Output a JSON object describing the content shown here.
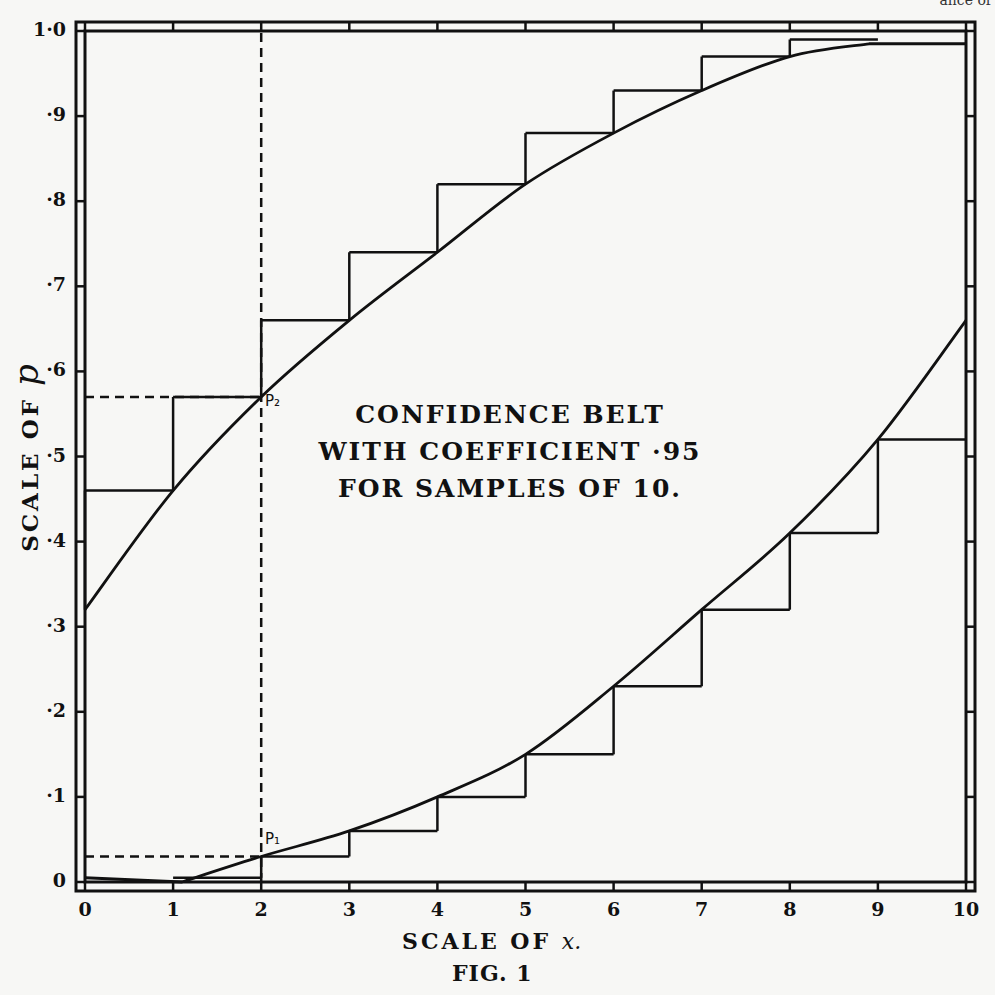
{
  "header_fragment": "ance of",
  "figure": {
    "title_lines": [
      "CONFIDENCE BELT",
      "WITH COEFFICIENT ·95",
      "FOR SAMPLES OF 10."
    ],
    "caption": "FIG. 1",
    "x_axis_title": "SCALE OF",
    "x_axis_var": "x.",
    "y_axis_title": "SCALE OF",
    "y_axis_var": "p",
    "point_labels": {
      "p1": "P₁",
      "p2": "P₂"
    },
    "x_tick_labels": [
      "0",
      "1",
      "2",
      "3",
      "4",
      "5",
      "6",
      "7",
      "8",
      "9",
      "10"
    ],
    "y_tick_labels": [
      "0",
      "·1",
      "·2",
      "·3",
      "·4",
      "·5",
      "·6",
      "·7",
      "·8",
      "·9",
      "1·0"
    ]
  },
  "colors": {
    "ink": "#111111",
    "paper": "#f7f7f5"
  },
  "chart_data": {
    "type": "line",
    "caption": "FIG. 1",
    "xlabel": "Scale of x",
    "ylabel": "Scale of p",
    "xlim": [
      0,
      10
    ],
    "ylim": [
      0,
      1.0
    ],
    "x_ticks": [
      0,
      1,
      2,
      3,
      4,
      5,
      6,
      7,
      8,
      9,
      10
    ],
    "y_ticks": [
      0,
      0.1,
      0.2,
      0.3,
      0.4,
      0.5,
      0.6,
      0.7,
      0.8,
      0.9,
      1.0
    ],
    "grid": false,
    "series": [
      {
        "name": "Upper confidence limit (smooth curve)",
        "x": [
          0,
          1,
          2,
          3,
          4,
          5,
          6,
          7,
          8,
          8.9
        ],
        "y": [
          0.32,
          0.46,
          0.57,
          0.66,
          0.74,
          0.82,
          0.88,
          0.93,
          0.97,
          0.985
        ]
      },
      {
        "name": "Upper confidence limit (step function)",
        "steps": [
          {
            "x0": 0,
            "x1": 1,
            "y": 0.46
          },
          {
            "x0": 1,
            "x1": 2,
            "y": 0.57
          },
          {
            "x0": 2,
            "x1": 3,
            "y": 0.66
          },
          {
            "x0": 3,
            "x1": 4,
            "y": 0.74
          },
          {
            "x0": 4,
            "x1": 5,
            "y": 0.82
          },
          {
            "x0": 5,
            "x1": 6,
            "y": 0.88
          },
          {
            "x0": 6,
            "x1": 7,
            "y": 0.93
          },
          {
            "x0": 7,
            "x1": 8,
            "y": 0.97
          },
          {
            "x0": 8,
            "x1": 9,
            "y": 0.99
          }
        ]
      },
      {
        "name": "Lower confidence limit (smooth curve)",
        "x": [
          1.1,
          2,
          3,
          4,
          5,
          6,
          7,
          8,
          9,
          10
        ],
        "y": [
          0.0,
          0.03,
          0.06,
          0.1,
          0.15,
          0.23,
          0.32,
          0.41,
          0.52,
          0.66
        ]
      },
      {
        "name": "Lower confidence limit (step function)",
        "steps": [
          {
            "x0": 1,
            "x1": 2,
            "y": 0.005
          },
          {
            "x0": 2,
            "x1": 3,
            "y": 0.03
          },
          {
            "x0": 3,
            "x1": 4,
            "y": 0.06
          },
          {
            "x0": 4,
            "x1": 5,
            "y": 0.1
          },
          {
            "x0": 5,
            "x1": 6,
            "y": 0.15
          },
          {
            "x0": 6,
            "x1": 7,
            "y": 0.23
          },
          {
            "x0": 7,
            "x1": 8,
            "y": 0.32
          },
          {
            "x0": 8,
            "x1": 9,
            "y": 0.41
          },
          {
            "x0": 9,
            "x1": 10,
            "y": 0.52
          }
        ]
      }
    ],
    "annotations": [
      {
        "label": "P1",
        "x": 2,
        "y": 0.03
      },
      {
        "label": "P2",
        "x": 2,
        "y": 0.57
      },
      {
        "type": "dashed-vertical",
        "x": 2,
        "y_from": 0,
        "y_to": 1.0
      },
      {
        "type": "dashed-horizontal",
        "y": 0.57,
        "x_from": 0,
        "x_to": 2
      },
      {
        "type": "dashed-horizontal",
        "y": 0.03,
        "x_from": 0,
        "x_to": 2
      }
    ]
  }
}
